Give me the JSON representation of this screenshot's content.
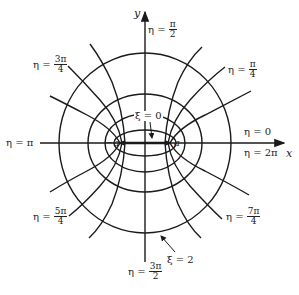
{
  "diagram": {
    "type": "elliptic-coordinates",
    "axes": {
      "x_label": "x",
      "y_label": "y"
    },
    "foci": {
      "left": "−a",
      "right": "a"
    },
    "xi_labels": {
      "inner": "ξ = 0",
      "outer": "ξ = 2"
    },
    "eta_labels": {
      "e0": "η = 0",
      "e2pi": "η = 2π",
      "pi": "η = π",
      "pi2": {
        "lhs": "η =",
        "num": "π",
        "den": "2"
      },
      "pi4": {
        "lhs": "η =",
        "num": "π",
        "den": "4"
      },
      "3pi4": {
        "lhs": "η =",
        "num": "3π",
        "den": "4"
      },
      "5pi4": {
        "lhs": "η =",
        "num": "5π",
        "den": "4"
      },
      "7pi4": {
        "lhs": "η =",
        "num": "7π",
        "den": "4"
      },
      "3pi2": {
        "lhs": "η =",
        "num": "3π",
        "den": "2"
      }
    },
    "colors": {
      "line": "#1a1a1a",
      "text": "#222222",
      "background": "#ffffff"
    }
  }
}
